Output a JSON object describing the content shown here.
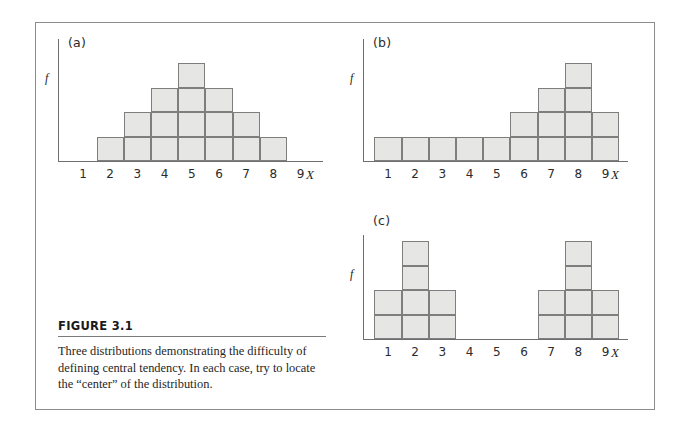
{
  "figure": {
    "caption_title": "FIGURE 3.1",
    "caption_text": "Three distributions demonstrating the difficulty of defining central tendency. In each case, try to locate the “center” of the distribution.",
    "frame_color": "#8d8d8d",
    "bar_fill_color": "#e6e6e4",
    "bar_stroke_color": "#7e7e7e",
    "axis_color": "#6f6f6f"
  },
  "chart_data": [
    {
      "type": "bar",
      "panel_label": "(a)",
      "title": "",
      "xlabel": "X",
      "ylabel": "f",
      "categories": [
        "1",
        "2",
        "3",
        "4",
        "5",
        "6",
        "7",
        "8",
        "9"
      ],
      "values": [
        0,
        1,
        2,
        3,
        4,
        3,
        2,
        1,
        0
      ],
      "ylim": [
        0,
        5
      ],
      "grid": false,
      "legend": "none",
      "note": "symmetric unimodal distribution"
    },
    {
      "type": "bar",
      "panel_label": "(b)",
      "title": "",
      "xlabel": "X",
      "ylabel": "f",
      "categories": [
        "1",
        "2",
        "3",
        "4",
        "5",
        "6",
        "7",
        "8",
        "9"
      ],
      "values": [
        1,
        1,
        1,
        1,
        1,
        2,
        3,
        4,
        2
      ],
      "ylim": [
        0,
        5
      ],
      "grid": false,
      "legend": "none",
      "note": "negatively skewed distribution"
    },
    {
      "type": "bar",
      "panel_label": "(c)",
      "title": "",
      "xlabel": "X",
      "ylabel": "f",
      "categories": [
        "1",
        "2",
        "3",
        "4",
        "5",
        "6",
        "7",
        "8",
        "9"
      ],
      "values": [
        2,
        4,
        2,
        0,
        0,
        0,
        2,
        4,
        2
      ],
      "ylim": [
        0,
        5
      ],
      "grid": false,
      "legend": "none",
      "note": "bimodal distribution"
    }
  ]
}
